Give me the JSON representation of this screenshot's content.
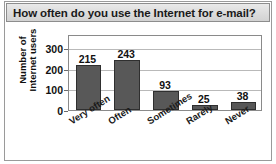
{
  "chart_data": {
    "type": "bar",
    "title": "How often do you use the Internet for e-mail?",
    "xlabel": "",
    "ylabel": "Number of\nInternet users",
    "categories": [
      "Very often",
      "Often",
      "Sometimes",
      "Rarely",
      "Never"
    ],
    "values": [
      215,
      243,
      93,
      25,
      38
    ],
    "value_labels": [
      "215",
      "243",
      "93",
      "25",
      "38"
    ],
    "yticks": [
      0,
      100,
      200,
      300
    ],
    "ytick_labels": [
      "0",
      "100",
      "200",
      "300"
    ],
    "ylim": [
      0,
      367
    ],
    "grid": "horizontal",
    "legend": "none",
    "bar_color": "#585858",
    "bar_edge_color": "#2f2f2f",
    "title_background": "#dcdcdc",
    "plot_border_color": "#8a8a8a",
    "grid_color": "#b9b9b9"
  }
}
